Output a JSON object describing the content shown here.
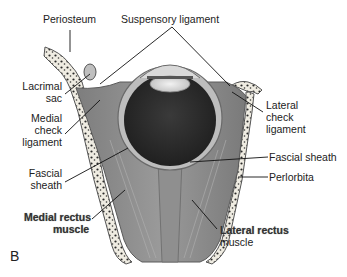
{
  "figure": {
    "panel_label": "B"
  },
  "labels": {
    "periosteum": "Periosteum",
    "suspensory_ligament": "Suspensory ligament",
    "lacrimal_sac_1": "Lacrimal",
    "lacrimal_sac_2": "sac",
    "medial_check_1": "Medial",
    "medial_check_2": "check",
    "medial_check_3": "ligament",
    "lateral_check_1": "Lateral",
    "lateral_check_2": "check",
    "lateral_check_3": "ligament",
    "fascial_sheath_right": "Fascial sheath",
    "periorbita": "Perlorbita",
    "fascial_sheath_left_1": "Fascial",
    "fascial_sheath_left_2": "sheath",
    "medial_rectus_1": "Medial rectus",
    "medial_rectus_2": "muscle",
    "lateral_rectus_1": "Lateral rectus",
    "lateral_rectus_2": "muscle"
  },
  "colors": {
    "bone": "#f3f0e6",
    "bone_dots": "#2a2a2a",
    "muscle": "#8a8a8a",
    "globe_dark": "#2d2d2d",
    "line": "#111111"
  }
}
